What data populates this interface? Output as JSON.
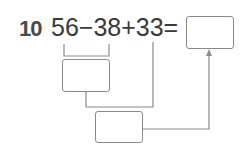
{
  "problem": {
    "number": "10",
    "expression": "56−38+33=",
    "terms": [
      "56",
      "38",
      "33"
    ],
    "operators": [
      "−",
      "+",
      "="
    ]
  },
  "boxes": {
    "answer": "",
    "step1": "",
    "step2": ""
  },
  "colors": {
    "text": "#3a3a3a",
    "lines": "#8a8a8a"
  }
}
